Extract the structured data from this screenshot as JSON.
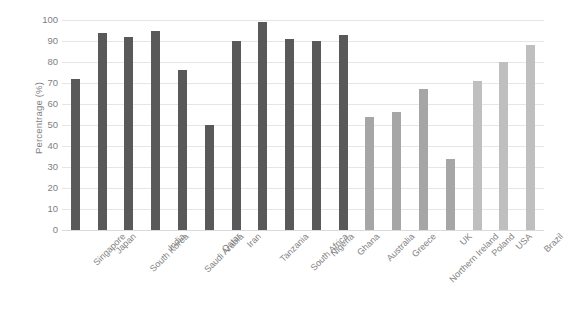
{
  "chart_data": {
    "type": "bar",
    "title": "",
    "subtitle": "",
    "xlabel": "",
    "ylabel": "Percentrage (%)",
    "ylim": [
      0,
      100
    ],
    "ytick_step": 10,
    "yticks": [
      100,
      90,
      80,
      70,
      60,
      50,
      40,
      30,
      20,
      10,
      0
    ],
    "grid": true,
    "legend": "none",
    "categories": [
      "Singapore",
      "Japan",
      "South Korea",
      "India",
      "Saudi Arabia",
      "Qatar",
      "Iran",
      "Tanzania",
      "South Africa",
      "Nigeria",
      "Ghana",
      "Australia",
      "Greece",
      "Northern Ireland",
      "UK",
      "Poland",
      "USA",
      "Brazil"
    ],
    "values": [
      72,
      94,
      92,
      95,
      76,
      50,
      90,
      99,
      91,
      90,
      93,
      54,
      56,
      67,
      34,
      71,
      80,
      88
    ],
    "bar_colors": [
      "#595959",
      "#595959",
      "#595959",
      "#595959",
      "#595959",
      "#595959",
      "#595959",
      "#595959",
      "#595959",
      "#595959",
      "#595959",
      "#a6a6a6",
      "#a6a6a6",
      "#a6a6a6",
      "#a6a6a6",
      "#bfbfbf",
      "#bfbfbf",
      "#bfbfbf"
    ]
  },
  "style": {
    "dark_bar_color": "#595959",
    "mid_bar_color": "#a6a6a6",
    "light_bar_color": "#bfbfbf",
    "gridline_color": "#e6e6e6",
    "axis_text_color": "#7f7f7f",
    "background_color": "#ffffff"
  }
}
